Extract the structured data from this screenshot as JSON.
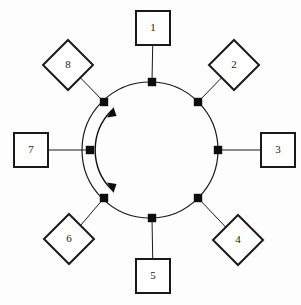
{
  "diagram": {
    "type": "ring-topology",
    "canvas": {
      "width": 301,
      "height": 305
    },
    "colors": {
      "background": "#fdfdfd",
      "stroke": "#1a1a1a",
      "marker": "#0d0d0d",
      "shape_fill": "#ffffff"
    },
    "ring": {
      "center_x": 150,
      "center_y": 150,
      "radius": 68,
      "label": "ring-bus"
    },
    "flow": {
      "direction": "bidirectional",
      "arrow_count": 2,
      "side": "left-interior",
      "label": "bidirectional data flow"
    },
    "nodes": [
      {
        "id": 1,
        "label": "1",
        "shape": "square",
        "angle_deg": 270,
        "x": 153,
        "y": 28,
        "size": 34,
        "tap_x": 152,
        "tap_y": 82
      },
      {
        "id": 2,
        "label": "2",
        "shape": "diamond",
        "angle_deg": 315,
        "x": 234,
        "y": 65,
        "size": 25,
        "tap_x": 198,
        "tap_y": 102
      },
      {
        "id": 3,
        "label": "3",
        "shape": "square",
        "angle_deg": 0,
        "x": 278,
        "y": 150,
        "size": 34,
        "tap_x": 218,
        "tap_y": 150
      },
      {
        "id": 4,
        "label": "4",
        "shape": "diamond",
        "angle_deg": 45,
        "x": 238,
        "y": 240,
        "size": 25,
        "tap_x": 198,
        "tap_y": 198
      },
      {
        "id": 5,
        "label": "5",
        "shape": "square",
        "angle_deg": 90,
        "x": 153,
        "y": 276,
        "size": 34,
        "tap_x": 152,
        "tap_y": 218
      },
      {
        "id": 6,
        "label": "6",
        "shape": "diamond",
        "angle_deg": 135,
        "x": 69,
        "y": 239,
        "size": 25,
        "tap_x": 104,
        "tap_y": 198
      },
      {
        "id": 7,
        "label": "7",
        "shape": "square",
        "angle_deg": 180,
        "x": 31,
        "y": 150,
        "size": 34,
        "tap_x": 90,
        "tap_y": 150
      },
      {
        "id": 8,
        "label": "8",
        "shape": "diamond",
        "angle_deg": 225,
        "x": 68,
        "y": 65,
        "size": 25,
        "tap_x": 104,
        "tap_y": 102
      }
    ]
  }
}
